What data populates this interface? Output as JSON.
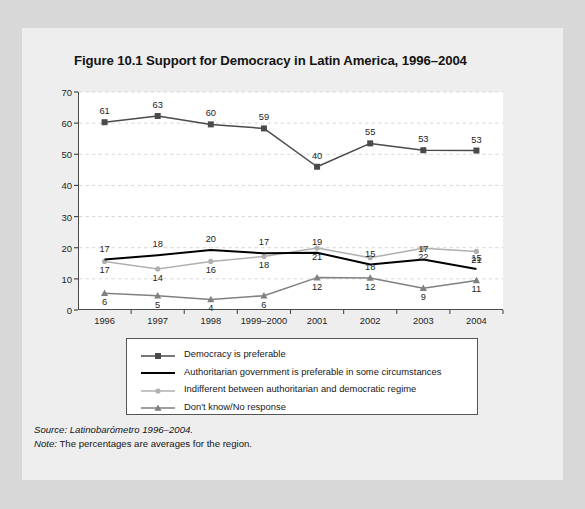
{
  "figure": {
    "title": "Figure 10.1 Support for Democracy in Latin America, 1996–2004",
    "source_prefix": "Source:",
    "source_text": "Latinobarómetro 1996–2004.",
    "note_prefix": "Note:",
    "note_text": "The percentages are averages for the region."
  },
  "colors": {
    "page_background": "#d8d8d8",
    "card_background": "#eeeeee",
    "plot_background": "#ffffff",
    "axis": "#4b4b4b",
    "gridline": "#d9d9d9",
    "series_democracy": "#4a4a4a",
    "series_authoritarian": "#000000",
    "series_indifferent": "#b0b0b0",
    "series_dontknow": "#808080",
    "text": "#141414"
  },
  "chart_data": {
    "type": "line",
    "title": "Figure 10.1 Support for Democracy in Latin America, 1996–2004",
    "xlabel": "",
    "ylabel": "",
    "ylim": [
      0,
      70
    ],
    "yticks": [
      0,
      10,
      20,
      30,
      40,
      50,
      60,
      70
    ],
    "grid": true,
    "legend_position": "below-plot",
    "categories": [
      "1996",
      "1997",
      "1998",
      "1999–2000",
      "2001",
      "2002",
      "2003",
      "2004"
    ],
    "series": [
      {
        "name": "Democracy is preferable",
        "marker": "square",
        "color": "#4a4a4a",
        "values": [
          61,
          63,
          60,
          59,
          40,
          55,
          53,
          53
        ],
        "plot_values": [
          60.3,
          62.3,
          59.6,
          58.3,
          46.0,
          53.5,
          51.3,
          51.2
        ],
        "label_offset": "above"
      },
      {
        "name": "Authoritarian government is preferable in some circumstances",
        "marker": "none",
        "color": "#000000",
        "values": [
          17,
          18,
          20,
          17,
          19,
          15,
          17,
          15
        ],
        "plot_values": [
          16.2,
          17.6,
          19.3,
          18.2,
          18.4,
          14.6,
          16.2,
          13.2
        ],
        "label_offset": "above"
      },
      {
        "name": "Indifferent between authoritarian and democratic regime",
        "marker": "circle",
        "color": "#b0b0b0",
        "values": [
          17,
          14,
          16,
          18,
          21,
          18,
          22,
          21
        ],
        "plot_values": [
          15.6,
          13.2,
          15.6,
          17.2,
          19.9,
          16.8,
          19.8,
          18.8
        ],
        "label_offset": "below"
      },
      {
        "name": "Don't know/No response",
        "marker": "triangle",
        "color": "#808080",
        "values": [
          6,
          5,
          4,
          6,
          12,
          12,
          9,
          11
        ],
        "plot_values": [
          5.4,
          4.6,
          3.4,
          4.6,
          10.4,
          10.3,
          7.0,
          9.5
        ],
        "label_offset": "below"
      }
    ]
  }
}
